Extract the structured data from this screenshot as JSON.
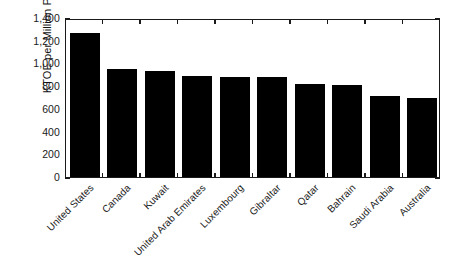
{
  "chart_data": {
    "type": "bar",
    "title": "",
    "subtitle": "",
    "xlabel": "",
    "ylabel": "KTOE per Million People",
    "categories": [
      "United States",
      "Canada",
      "Kuwait",
      "United Arab Emirates",
      "Luxembourg",
      "Gibraltar",
      "Qatar",
      "Bahrain",
      "Saudi Arabia",
      "Australia"
    ],
    "values": [
      1270,
      953,
      930,
      893,
      885,
      882,
      822,
      812,
      710,
      700
    ],
    "ylim": [
      0,
      1400
    ],
    "yticks": [
      0,
      200,
      400,
      600,
      800,
      1000,
      1200,
      1400
    ],
    "ytick_labels": [
      "0",
      "200",
      "400",
      "600",
      "800",
      "1,000",
      "1,200",
      "1,400"
    ],
    "grid": false,
    "legend": null,
    "legend_position": "none",
    "bar_color": "#000000",
    "axis_color": "#1a1a1a",
    "background_color": "#ffffff",
    "annotations": []
  }
}
